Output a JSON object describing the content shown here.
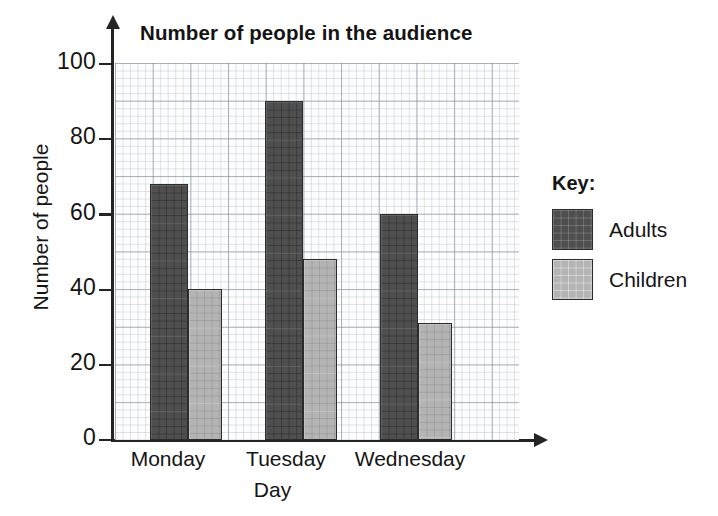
{
  "chart_data": {
    "type": "bar",
    "title": "Number of people in the audience",
    "xlabel": "Day",
    "ylabel": "Number of people",
    "categories": [
      "Monday",
      "Tuesday",
      "Wednesday"
    ],
    "series": [
      {
        "name": "Adults",
        "values": [
          68,
          90,
          60
        ],
        "color": "#4f4f4f"
      },
      {
        "name": "Children",
        "values": [
          40,
          48,
          31
        ],
        "color": "#b4b4b4"
      }
    ],
    "ylim": [
      0,
      100
    ],
    "yticks": [
      0,
      20,
      40,
      60,
      80,
      100
    ],
    "ytick_labels": [
      "0",
      "20",
      "40",
      "60",
      "80",
      "100"
    ],
    "grid": true,
    "grid_minor_units": 2,
    "grid_major_units": 10,
    "legend_position": "right"
  },
  "legend": {
    "title": "Key:",
    "entries": [
      {
        "label": "Adults",
        "color": "#4f4f4f"
      },
      {
        "label": "Children",
        "color": "#b4b4b4"
      }
    ]
  }
}
